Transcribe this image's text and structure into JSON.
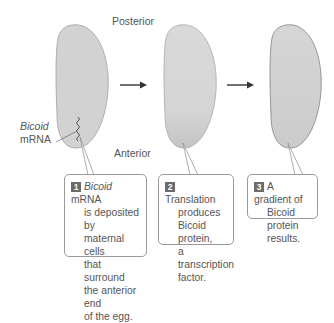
{
  "labels": {
    "posterior": "Posterior",
    "anterior": "Anterior",
    "bicoid_italic": "Bicoid",
    "mrna": "mRNA"
  },
  "steps": [
    {
      "number": "1",
      "lines": [
        "",
        "is deposited by",
        "maternal cells",
        "that surround",
        "the anterior end",
        "of the egg."
      ],
      "first_italic": "Bicoid",
      "first_rest": " mRNA"
    },
    {
      "number": "2",
      "lines": [
        "Translation",
        "produces",
        "Bicoid protein,",
        "a transcription",
        "factor."
      ]
    },
    {
      "number": "3",
      "lines": [
        "A gradient of",
        "Bicoid protein",
        "results."
      ]
    }
  ],
  "colors": {
    "egg_fill": "#d2d2d2",
    "egg_stroke": "#9a9a9a",
    "arrow": "#333333",
    "badge": "#6b6b6b"
  }
}
